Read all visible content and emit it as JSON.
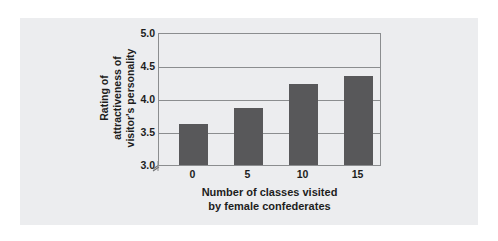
{
  "chart_data": {
    "type": "bar",
    "title": "",
    "subtitle": "",
    "categories": [
      "0",
      "5",
      "10",
      "15"
    ],
    "values": [
      3.61,
      3.86,
      4.22,
      4.34
    ],
    "series": [
      {
        "name": "Rating of attractiveness of visitor's personality",
        "values": [
          3.61,
          3.86,
          4.22,
          4.34
        ]
      }
    ],
    "xlabel": "Number of classes visited by female confederates",
    "xlabel_lines": [
      "Number of classes visited",
      "by female confederates"
    ],
    "ylabel": "Rating of attractiveness of visitor's personality",
    "ylabel_lines": [
      "Rating of",
      "attractiveness of",
      "visitor's personality"
    ],
    "ylim": [
      3.0,
      5.0
    ],
    "yticks": [
      "5.0",
      "4.5",
      "4.0",
      "3.5",
      "3.0"
    ],
    "ytick_values": [
      5.0,
      4.5,
      4.0,
      3.5,
      3.0
    ],
    "xticks": [
      "0",
      "5",
      "10",
      "15"
    ],
    "grid": "horizontal",
    "legend": "none",
    "axis_break": true,
    "bar_color": "#58585a",
    "grid_color": "#8b8d8f",
    "panel_color": "#ecedef",
    "text_color": "#1d1d1d"
  }
}
